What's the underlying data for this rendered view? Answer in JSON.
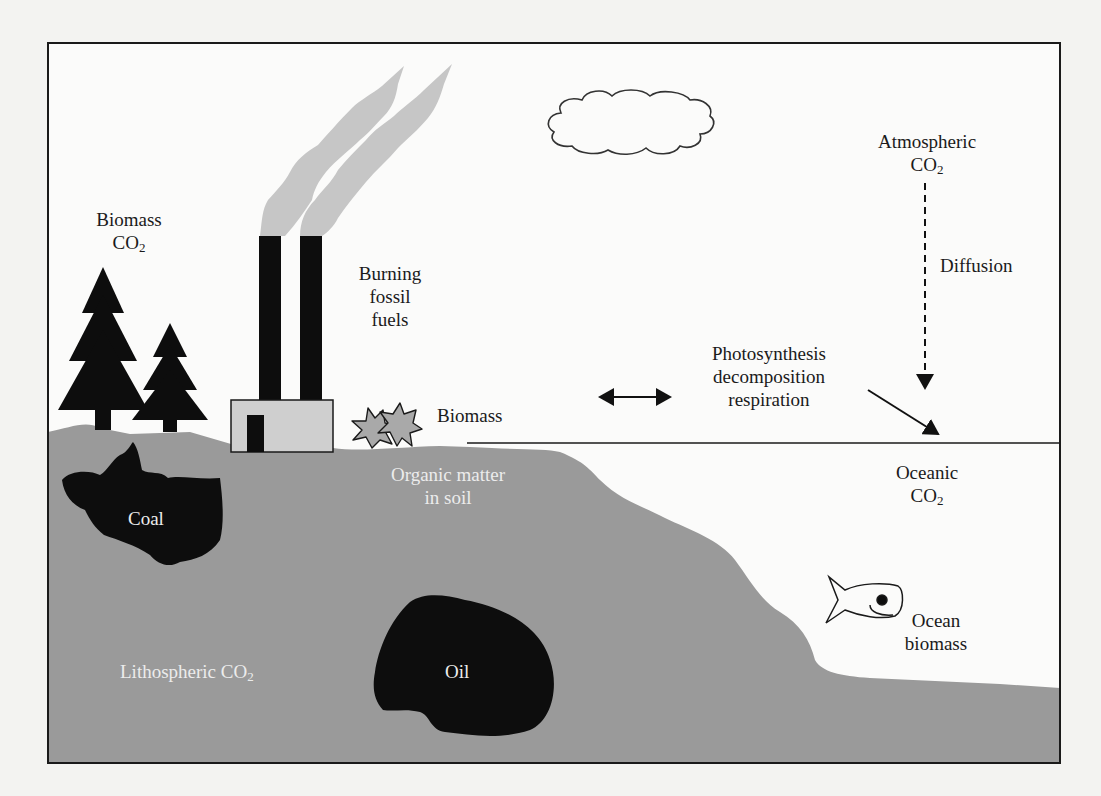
{
  "diagram": {
    "colors": {
      "page_background": "#f3f3f1",
      "sky": "#fbfbfa",
      "ground": "#9a9a9a",
      "fossil_deposit": "#0d0d0d",
      "smoke": "#c6c6c6",
      "factory_wall": "#cfcfcf",
      "outline": "#1a1a1a",
      "ink": "#1a1a1a",
      "label_on_ground": "#ececec"
    },
    "frame": {
      "x": 48,
      "y": 43,
      "width": 1012,
      "height": 720
    },
    "ocean_surface_line": {
      "x1": 467,
      "y1": 443,
      "x2": 1060,
      "y2": 443
    }
  },
  "labels": {
    "biomass_co2": {
      "line1": "Biomass",
      "line2": "CO",
      "sub": "2"
    },
    "burning_fossil_fuels": {
      "line1": "Burning",
      "line2": "fossil",
      "line3": "fuels"
    },
    "atmospheric_co2": {
      "line1": "Atmospheric",
      "line2": "CO",
      "sub": "2"
    },
    "diffusion": "Diffusion",
    "photosynthesis": {
      "line1": "Photosynthesis",
      "line2": "decomposition",
      "line3": "respiration"
    },
    "biomass": "Biomass",
    "organic_matter": {
      "line1": "Organic matter",
      "line2": "in soil"
    },
    "oceanic_co2": {
      "line1": "Oceanic",
      "line2": "CO",
      "sub": "2"
    },
    "coal": "Coal",
    "oil": "Oil",
    "lithospheric_co2": {
      "text": "Lithospheric CO",
      "sub": "2"
    },
    "ocean_biomass": {
      "line1": "Ocean",
      "line2": "biomass"
    }
  },
  "elements": {
    "trees": [
      {
        "name": "large-pine-tree",
        "cx": 103,
        "base_y": 430,
        "height": 165
      },
      {
        "name": "small-pine-tree",
        "cx": 170,
        "base_y": 430,
        "height": 108
      }
    ],
    "factory": {
      "building": {
        "x": 231,
        "y": 400,
        "width": 102,
        "height": 52
      },
      "door": {
        "x": 247,
        "y": 415,
        "width": 17,
        "height": 37
      },
      "chimneys": [
        {
          "x": 259,
          "y": 236,
          "width": 22,
          "height": 164
        },
        {
          "x": 300,
          "y": 236,
          "width": 22,
          "height": 164
        }
      ]
    },
    "cloud": {
      "x": 543,
      "y": 89,
      "width": 172,
      "height": 66
    },
    "arrows": {
      "exchange": {
        "x1": 598,
        "y1": 397,
        "x2": 672,
        "y2": 397,
        "style": "double-headed"
      },
      "diffusion": {
        "x1": 925,
        "y1": 183,
        "x2": 925,
        "y2": 390,
        "style": "dashed"
      },
      "photosynthesis_to_ocean": {
        "x1": 868,
        "y1": 390,
        "x2": 938,
        "y2": 434,
        "style": "solid"
      }
    },
    "fish": {
      "x": 826,
      "y": 577,
      "width": 76,
      "height": 46
    }
  }
}
